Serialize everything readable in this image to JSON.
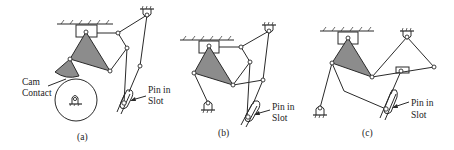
{
  "figure": {
    "panels": [
      {
        "id": "a",
        "caption": "(a)",
        "labels": {
          "cam_line1": "Cam",
          "cam_line2": "Contact",
          "pin_line1": "Pin in",
          "pin_line2": "Slot"
        }
      },
      {
        "id": "b",
        "caption": "(b)",
        "labels": {
          "pin_line1": "Pin in",
          "pin_line2": "Slot"
        }
      },
      {
        "id": "c",
        "caption": "(c)",
        "labels": {
          "pin_line1": "Pin in",
          "pin_line2": "Slot"
        }
      }
    ],
    "colors": {
      "link": "#2a2a2a",
      "triangle_fill": "#8c8c8c",
      "background": "#ffffff"
    }
  }
}
